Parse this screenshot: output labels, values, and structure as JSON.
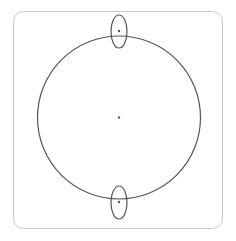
{
  "diagram": {
    "colors": {
      "background": "#ffffff",
      "frame": "#c8c8c8",
      "stroke": "#555555",
      "dot": "#555555"
    },
    "frame": {
      "x": 13,
      "y": 11,
      "width": 209,
      "height": 217,
      "radius": 10
    },
    "main_circle": {
      "cx": 119,
      "cy": 117.5,
      "r": 81.5
    },
    "center_point": {
      "cx": 119,
      "cy": 117.5
    },
    "top_ellipse": {
      "cx": 119,
      "cy": 31.5,
      "rx": 8,
      "ry": 16.5
    },
    "top_point": {
      "cx": 119,
      "cy": 31
    },
    "bottom_ellipse": {
      "cx": 119,
      "cy": 202.5,
      "rx": 8,
      "ry": 16.5
    },
    "bottom_point": {
      "cx": 119,
      "cy": 202
    }
  }
}
